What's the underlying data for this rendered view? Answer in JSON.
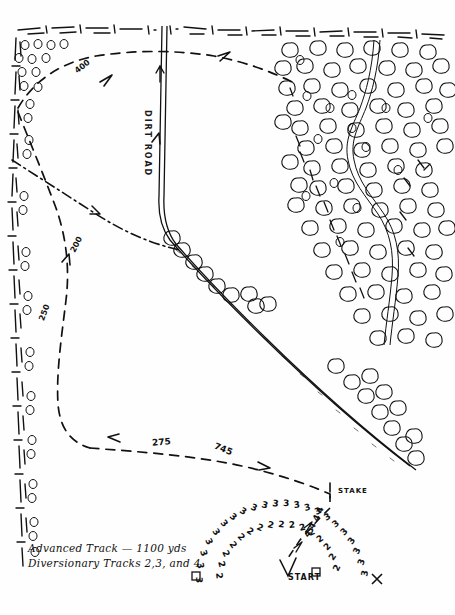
{
  "map": {
    "title": "Hand-drawn tracking exercise map",
    "background_color": "#fefefe",
    "ink_color": "#111111",
    "width": 455,
    "height": 615
  },
  "legend": {
    "line1": "Advanced Track — 1100 yds",
    "line2": "Diversionary Tracks 2,3, and 4"
  },
  "labels": {
    "road": "DIRT ROAD",
    "start": "START",
    "stake": "STAKE"
  },
  "distance_markers": [
    {
      "text": "400",
      "x": 74,
      "y": 68,
      "rotate": -38
    },
    {
      "text": "200",
      "x": 68,
      "y": 244,
      "rotate": -62
    },
    {
      "text": "250",
      "x": 36,
      "y": 312,
      "rotate": -70
    },
    {
      "text": "275",
      "x": 152,
      "y": 440,
      "rotate": -6
    },
    {
      "text": "745",
      "x": 214,
      "y": 447,
      "rotate": 22
    }
  ],
  "diversionary_arcs": [
    {
      "name": "arc-3",
      "digit": "3",
      "count": 26
    },
    {
      "name": "arc-2",
      "digit": "2",
      "count": 22
    },
    {
      "name": "arc-4",
      "digit": "4",
      "count": 14
    }
  ],
  "features": {
    "orchard_name": "orchard-tree-cluster",
    "hedge_top": "top-hedge-boundary",
    "hedge_left": "left-hedge-boundary",
    "road_name": "dirt-road",
    "advanced_track": "advanced-track-dashed",
    "diversionary_track": "diversionary-track-dotdash",
    "footpath": "orchard-footpath"
  }
}
